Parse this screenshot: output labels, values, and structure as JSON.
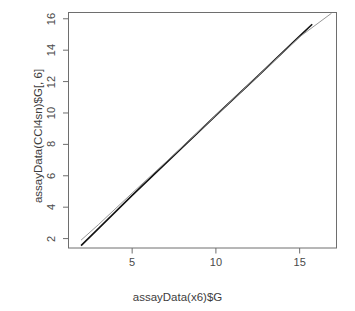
{
  "chart_data": {
    "type": "line",
    "title": "",
    "subtitle": "",
    "xlabel": "assayData(x6)$G",
    "ylabel": "assayData(CCl4sn)$G[, 6]",
    "xlim": [
      1.2,
      17.2
    ],
    "ylim": [
      1.4,
      16.4
    ],
    "xticks": [
      5,
      10,
      15
    ],
    "yticks": [
      2,
      4,
      6,
      8,
      10,
      12,
      14,
      16
    ],
    "xtick_labels": [
      "5",
      "10",
      "15"
    ],
    "ytick_labels": [
      "2",
      "4",
      "6",
      "8",
      "10",
      "12",
      "14",
      "16"
    ],
    "grid": false,
    "legend": "none",
    "box": true,
    "series": [
      {
        "name": "identity-line",
        "color": "#111111",
        "width": 1.6,
        "x": [
          1.95,
          3.0,
          5.0,
          7.5,
          10.0,
          12.5,
          15.0,
          15.75
        ],
        "y": [
          1.55,
          2.65,
          4.75,
          7.3,
          9.85,
          12.35,
          14.9,
          15.65
        ]
      },
      {
        "name": "regression-line",
        "color": "#8a8a8a",
        "width": 0.9,
        "x": [
          1.95,
          3.0,
          5.0,
          7.5,
          10.0,
          12.5,
          15.0,
          16.9
        ],
        "y": [
          1.9,
          2.9,
          4.9,
          7.35,
          9.85,
          12.35,
          14.85,
          16.35
        ]
      }
    ]
  },
  "axes": {
    "x_title": "assayData(x6)$G",
    "y_title": "assayData(CCl4sn)$G[, 6]",
    "x_ticks": [
      {
        "label": "5",
        "value": 5
      },
      {
        "label": "10",
        "value": 10
      },
      {
        "label": "15",
        "value": 15
      }
    ],
    "y_ticks": [
      {
        "label": "2",
        "value": 2
      },
      {
        "label": "4",
        "value": 4
      },
      {
        "label": "6",
        "value": 6
      },
      {
        "label": "8",
        "value": 8
      },
      {
        "label": "10",
        "value": 10
      },
      {
        "label": "12",
        "value": 12
      },
      {
        "label": "14",
        "value": 14
      },
      {
        "label": "16",
        "value": 16
      }
    ]
  },
  "colors": {
    "background": "#ffffff",
    "axis": "#6e6e6e",
    "text": "#3d3d3d",
    "primary_line": "#111111",
    "secondary_line": "#8a8a8a"
  }
}
